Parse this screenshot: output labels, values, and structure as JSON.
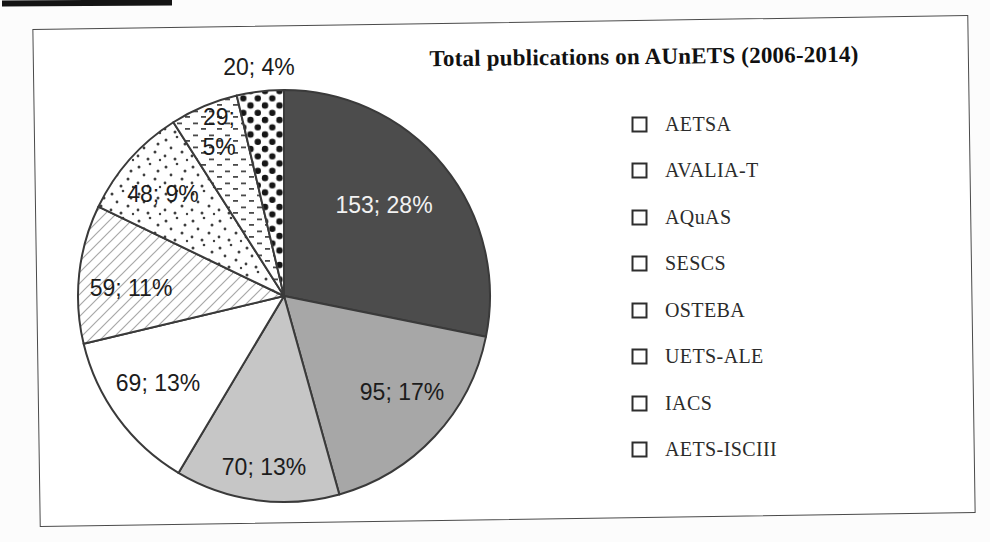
{
  "chart": {
    "frame_border_color": "#4a4a4a",
    "background": "#ffffff"
  },
  "chart_data": {
    "type": "pie",
    "title": "Total publications on AUnETS (2006-2014)",
    "total": 543,
    "label_format": "value; percent",
    "legend_position": "right",
    "geometry": {
      "cx": 284,
      "cy": 296,
      "r": 206,
      "stroke": "#3a3a3a",
      "stroke_width": 2
    },
    "slices": [
      {
        "name": "AETSA",
        "value": 153,
        "pct": 28,
        "label": "153; 28%",
        "fill_color": "#4c4c4c",
        "pattern": null,
        "label_color": "#f2f2f2",
        "label_x": 384,
        "label_y": 205
      },
      {
        "name": "AVALIA-T",
        "value": 95,
        "pct": 17,
        "label": "95; 17%",
        "fill_color": "#a7a7a7",
        "pattern": null,
        "label_color": "#1c1c1c",
        "label_x": 402,
        "label_y": 392
      },
      {
        "name": "AQuAS",
        "value": 70,
        "pct": 13,
        "label": "70; 13%",
        "fill_color": "#c6c6c6",
        "pattern": null,
        "label_color": "#1c1c1c",
        "label_x": 264,
        "label_y": 467
      },
      {
        "name": "SESCS",
        "value": 69,
        "pct": 13,
        "label": "69; 13%",
        "fill_color": "#ffffff",
        "pattern": null,
        "label_color": "#1c1c1c",
        "label_x": 158,
        "label_y": 383
      },
      {
        "name": "OSTEBA",
        "value": 59,
        "pct": 11,
        "label": "59; 11%",
        "fill_color": null,
        "pattern": "hatch-diagonal",
        "label_color": "#1c1c1c",
        "label_x": 131,
        "label_y": 288
      },
      {
        "name": "UETS-ALE",
        "value": 48,
        "pct": 9,
        "label": "48; 9%",
        "fill_color": null,
        "pattern": "dots-sparse",
        "label_color": "#1c1c1c",
        "label_x": 163,
        "label_y": 194
      },
      {
        "name": "IACS",
        "value": 29,
        "pct": 5,
        "label": "29;\n5%",
        "fill_color": null,
        "pattern": "dashes-fine",
        "label_color": "#1c1c1c",
        "label_x": 219,
        "label_y": 132
      },
      {
        "name": "AETS-ISCIII",
        "value": 20,
        "pct": 4,
        "label": "20; 4%",
        "fill_color": null,
        "pattern": "dots-large",
        "label_color": "#1c1c1c",
        "label_x": 259,
        "label_y": 67
      }
    ]
  }
}
